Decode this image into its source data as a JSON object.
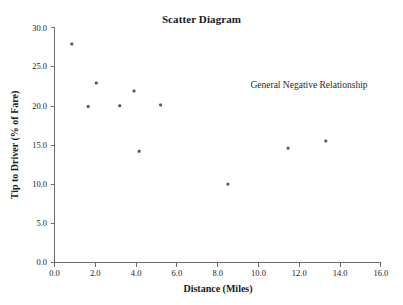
{
  "chart_data": {
    "type": "scatter",
    "title": "Scatter Diagram",
    "xlabel": "Distance (Miles)",
    "ylabel": "Tip to Driver (% of Fare)",
    "xlim": [
      0.0,
      16.0
    ],
    "ylim": [
      0.0,
      30.0
    ],
    "xticks": [
      "0.0",
      "2.0",
      "4.0",
      "6.0",
      "8.0",
      "10.0",
      "12.0",
      "14.0",
      "16.0"
    ],
    "xtick_values": [
      0.0,
      2.0,
      4.0,
      6.0,
      8.0,
      10.0,
      12.0,
      14.0,
      16.0
    ],
    "yticks": [
      "0.0",
      "5.0",
      "10.0",
      "15.0",
      "20.0",
      "25.0",
      "30.0"
    ],
    "ytick_values": [
      0.0,
      5.0,
      10.0,
      15.0,
      20.0,
      25.0,
      30.0
    ],
    "grid": false,
    "legend": false,
    "x": [
      0.85,
      1.65,
      2.05,
      3.2,
      3.9,
      4.15,
      5.2,
      8.5,
      11.45,
      13.3
    ],
    "y": [
      27.9,
      19.9,
      22.9,
      20.0,
      21.9,
      14.2,
      20.1,
      10.0,
      14.6,
      15.5
    ],
    "points": [
      {
        "x": 0.85,
        "y": 27.9
      },
      {
        "x": 1.65,
        "y": 19.9
      },
      {
        "x": 2.05,
        "y": 22.9
      },
      {
        "x": 3.2,
        "y": 20.0
      },
      {
        "x": 3.9,
        "y": 21.9
      },
      {
        "x": 4.15,
        "y": 14.2
      },
      {
        "x": 5.2,
        "y": 20.1
      },
      {
        "x": 8.5,
        "y": 10.0
      },
      {
        "x": 11.45,
        "y": 14.6
      },
      {
        "x": 13.3,
        "y": 15.5
      }
    ],
    "marker_color": "#595959",
    "marker_size": 3,
    "axis_color": "#6b6b6b",
    "annotations": [
      {
        "text": "General Negative Relationship",
        "x": 9.0,
        "y": 23.2
      }
    ]
  },
  "annotation": {
    "relationship_note": "General Negative Relationship"
  },
  "axes": {
    "x_title": "Distance (Miles)",
    "y_title": "Tip to Driver (% of Fare)"
  },
  "title": "Scatter Diagram"
}
